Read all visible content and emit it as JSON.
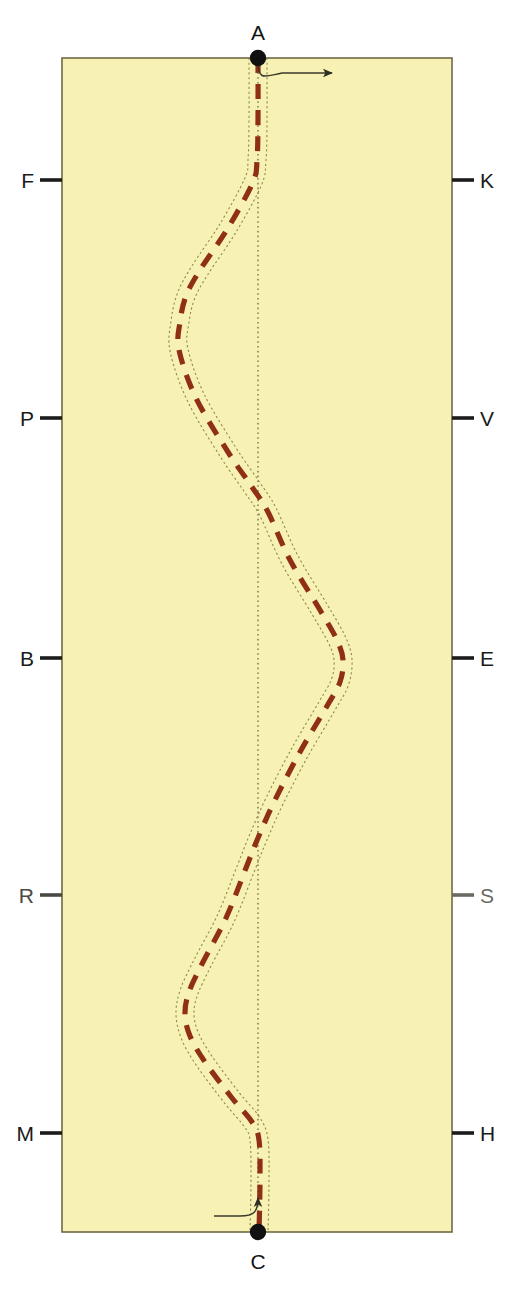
{
  "figure": {
    "type": "technical-diagram",
    "background_color": "#ffffff",
    "panel_color": "#f7f2b4",
    "panel_border_color": "#6e6a45",
    "path_color": "#8f2f15",
    "envelope_color": "#8a8b53",
    "centerline_color": "#6b6a45",
    "arrow_color": "#3a3a2a",
    "dot_color": "#111111",
    "panel": {
      "x": 62,
      "y": 58,
      "width": 390,
      "height": 1174
    }
  },
  "nodes": [
    {
      "id": "A",
      "label": "A",
      "label_color": "#141414",
      "x": 258,
      "y": 58,
      "label_x": 258,
      "label_y": 40,
      "label_anchor": "middle",
      "label_baseline": "auto"
    },
    {
      "id": "C",
      "label": "C",
      "label_color": "#141414",
      "x": 258,
      "y": 1232,
      "label_x": 258,
      "label_y": 1269,
      "label_anchor": "middle",
      "label_baseline": "auto"
    }
  ],
  "left_ticks": [
    {
      "label": "F",
      "y": 180,
      "color": "#1b1b1b"
    },
    {
      "label": "P",
      "y": 418,
      "color": "#1b1b1b"
    },
    {
      "label": "B",
      "y": 658,
      "color": "#1b1b1b"
    },
    {
      "label": "R",
      "y": 895,
      "color": "#4a4a44"
    },
    {
      "label": "M",
      "y": 1133,
      "color": "#1b1b1b"
    }
  ],
  "right_ticks": [
    {
      "label": "K",
      "y": 180,
      "color": "#1b1b1b"
    },
    {
      "label": "V",
      "y": 418,
      "color": "#1b1b1b"
    },
    {
      "label": "E",
      "y": 658,
      "color": "#1b1b1b"
    },
    {
      "label": "S",
      "y": 895,
      "color": "#6a6a62"
    },
    {
      "label": "H",
      "y": 1133,
      "color": "#1b1b1b"
    }
  ],
  "tick_geometry": {
    "left_tick_x1": 40,
    "left_tick_x2": 62,
    "right_tick_x1": 452,
    "right_tick_x2": 474,
    "left_label_x": 34,
    "right_label_x": 480
  },
  "centerline": {
    "x": 258,
    "y_top": 58,
    "y_bottom": 1232
  },
  "chart_data": {
    "type": "line",
    "title": "",
    "path_label": "meandering dashed path",
    "path_points": [
      [
        258,
        58
      ],
      [
        258,
        120
      ],
      [
        257,
        160
      ],
      [
        253,
        182
      ],
      [
        228,
        228
      ],
      [
        200,
        270
      ],
      [
        186,
        296
      ],
      [
        180,
        322
      ],
      [
        179,
        350
      ],
      [
        196,
        398
      ],
      [
        228,
        452
      ],
      [
        252,
        487
      ],
      [
        268,
        512
      ],
      [
        290,
        560
      ],
      [
        320,
        610
      ],
      [
        337,
        640
      ],
      [
        343,
        660
      ],
      [
        340,
        682
      ],
      [
        327,
        706
      ],
      [
        300,
        752
      ],
      [
        275,
        800
      ],
      [
        258,
        838
      ],
      [
        246,
        868
      ],
      [
        226,
        918
      ],
      [
        203,
        962
      ],
      [
        189,
        992
      ],
      [
        185,
        1014
      ],
      [
        190,
        1036
      ],
      [
        205,
        1062
      ],
      [
        232,
        1098
      ],
      [
        252,
        1122
      ],
      [
        259,
        1140
      ],
      [
        260,
        1180
      ],
      [
        259,
        1232
      ]
    ],
    "envelope_offset_px": 9
  },
  "arrows": {
    "top": {
      "name": "top-flow-arrow",
      "description": "curve leaving point A and turning to the right",
      "path": "M 258 62 C 258 82, 266 76, 282 73 L 332 73",
      "head_x": 332,
      "head_y": 73,
      "direction": "right"
    },
    "bottom": {
      "name": "bottom-flow-arrow",
      "description": "curve entering from the left and turning upward into point C",
      "path": "M 214 1216 L 240 1216 C 254 1216, 258 1212, 258 1198",
      "head_x": 258,
      "head_y": 1190,
      "direction": "up"
    }
  }
}
